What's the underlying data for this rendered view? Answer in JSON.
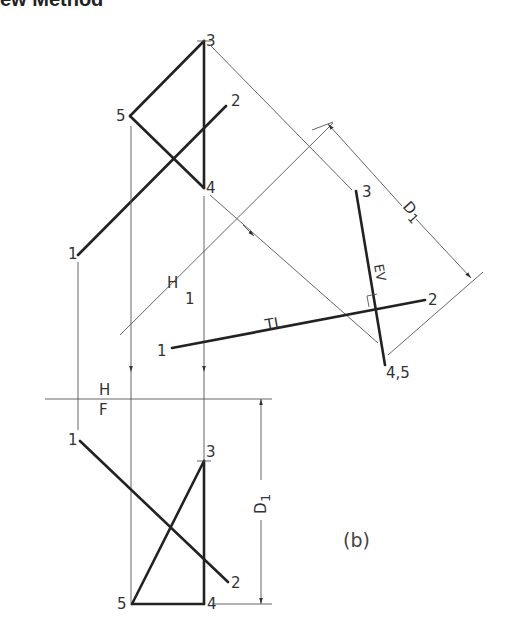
{
  "heading": "ew Method",
  "caption": "(b)",
  "top_view": {
    "points": {
      "p1": "1",
      "p2": "2",
      "p3": "3",
      "p4": "4",
      "p5": "5"
    }
  },
  "aux_view": {
    "points": {
      "p1": "1",
      "p2": "2",
      "p3": "3",
      "p45": "4,5"
    },
    "true_length_label": "TL",
    "edge_view_label": "EV",
    "distance_label": "D",
    "distance_sub": "1"
  },
  "fold_lines": {
    "hf_top": "H",
    "hf_bottom": "F",
    "h1_top": "H",
    "h1_bottom": "1"
  },
  "front_view": {
    "points": {
      "p1": "1",
      "p2": "2",
      "p3": "3",
      "p4": "4",
      "p5": "5"
    },
    "distance_label": "D",
    "distance_sub": "1"
  }
}
